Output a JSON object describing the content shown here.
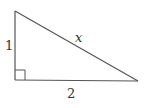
{
  "diagram": {
    "type": "right-triangle",
    "stroke_color": "#555555",
    "label_color": "#333333",
    "vertices": {
      "top": [
        15,
        11
      ],
      "right_angle": [
        15,
        80
      ],
      "right": [
        138,
        81
      ]
    },
    "sides": {
      "vertical_leg": {
        "label": "1"
      },
      "horizontal_leg": {
        "label": "2"
      },
      "hypotenuse": {
        "label": "x"
      }
    },
    "right_angle_marker": {
      "size": 10
    }
  }
}
